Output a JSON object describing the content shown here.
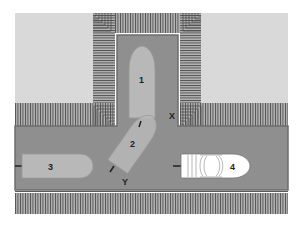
{
  "diagram": {
    "colors": {
      "background": "#ffffff",
      "land": "#d9d9d9",
      "dock": "#a8a8a8",
      "dock_lines": "#555555",
      "water": "#8f8f8f",
      "water_border": "#6e6e6e",
      "hull": "#b8b8b8",
      "hull_outline": "#9a9a9a",
      "motorboat": "#ffffff",
      "text": "#222222"
    },
    "boats": [
      {
        "id": "1",
        "label": "1",
        "position": "in slip, bow pointing up"
      },
      {
        "id": "2",
        "label": "2",
        "position": "angled, entering slip from channel"
      },
      {
        "id": "3",
        "label": "3",
        "position": "channel left, bow pointing right"
      },
      {
        "id": "4",
        "label": "4",
        "position": "channel right, motorboat with cabin, bow pointing right"
      }
    ],
    "points": [
      {
        "id": "X",
        "label": "X",
        "position": "right corner of slip entrance"
      },
      {
        "id": "Y",
        "label": "Y",
        "position": "below stern of boat 2"
      }
    ]
  }
}
